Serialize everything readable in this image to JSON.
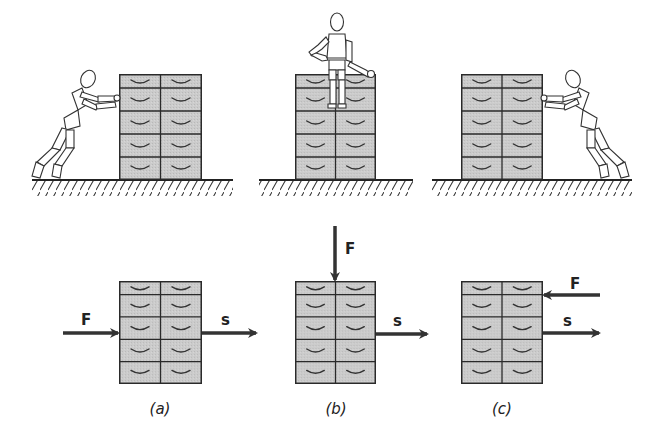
{
  "diagram": {
    "type": "physics-work-force-diagram",
    "colors": {
      "cabinet_fill": "#c9c9c9",
      "stroke": "#2a2a2a",
      "arrow": "#333333",
      "figure_fill": "#ffffff"
    },
    "top_row": {
      "scenes": [
        {
          "id": "a",
          "description": "figure pushing cabinet from left",
          "figure_position": "left",
          "cabinet": {
            "x": 119,
            "y": 74,
            "w": 83,
            "h": 106
          },
          "ground": {
            "x1": 32,
            "x2": 233,
            "y": 180
          }
        },
        {
          "id": "b",
          "description": "figure sitting on top of cabinet",
          "figure_position": "top",
          "cabinet": {
            "x": 295,
            "y": 74,
            "w": 81,
            "h": 106
          },
          "ground": {
            "x1": 259,
            "x2": 413,
            "y": 180
          }
        },
        {
          "id": "c",
          "description": "figure pushing cabinet from right",
          "figure_position": "right",
          "cabinet": {
            "x": 461,
            "y": 74,
            "w": 82,
            "h": 106
          },
          "ground": {
            "x1": 432,
            "x2": 632,
            "y": 180
          }
        }
      ]
    },
    "bottom_row": {
      "panels": [
        {
          "id": "a",
          "caption": "(a)",
          "cabinet": {
            "x": 119,
            "y": 281,
            "w": 83,
            "h": 103
          },
          "force": {
            "label": "F",
            "direction": "right",
            "x1": 63,
            "y1": 333,
            "x2": 119,
            "y2": 333
          },
          "displacement": {
            "label": "s",
            "direction": "right",
            "x1": 202,
            "y1": 333,
            "x2": 257,
            "y2": 333
          }
        },
        {
          "id": "b",
          "caption": "(b)",
          "cabinet": {
            "x": 295,
            "y": 281,
            "w": 81,
            "h": 103
          },
          "force": {
            "label": "F",
            "direction": "down",
            "x1": 335,
            "y1": 226,
            "x2": 335,
            "y2": 281
          },
          "displacement": {
            "label": "s",
            "direction": "right",
            "x1": 376,
            "y1": 334,
            "x2": 428,
            "y2": 334
          }
        },
        {
          "id": "c",
          "caption": "(c)",
          "cabinet": {
            "x": 461,
            "y": 281,
            "w": 82,
            "h": 103
          },
          "force": {
            "label": "F",
            "direction": "left",
            "x1": 600,
            "y1": 295,
            "x2": 543,
            "y2": 295
          },
          "displacement": {
            "label": "s",
            "direction": "right",
            "x1": 543,
            "y1": 333,
            "x2": 600,
            "y2": 333
          }
        }
      ]
    },
    "cabinet_layout": {
      "columns": 2,
      "drawers_per_column": 5,
      "handle_glyph": "curved-smile"
    }
  }
}
